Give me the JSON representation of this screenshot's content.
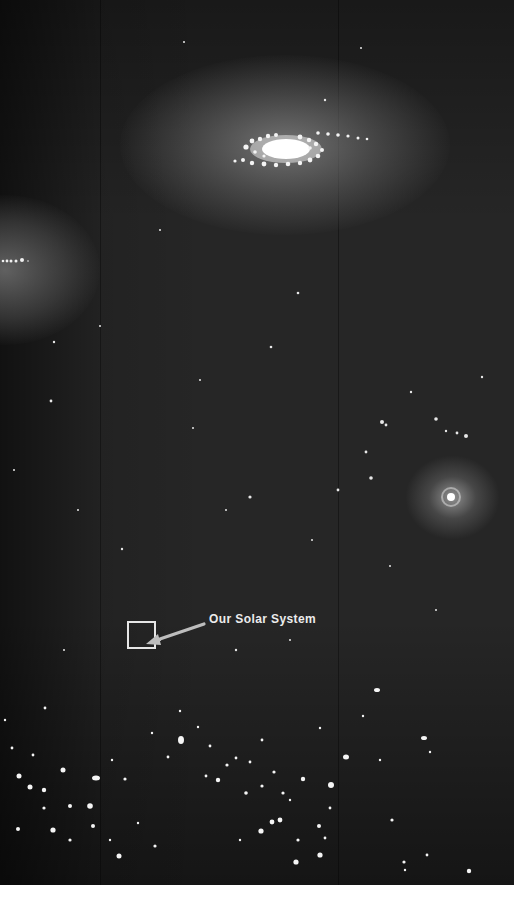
{
  "image": {
    "description": "Illustration of a spiral galaxy field with our Solar System's location marked",
    "background_color": "#262626",
    "margin_color": "#ffffff",
    "annotation": {
      "label": "Our Solar System",
      "label_color": "#ececec",
      "box_color": "#e6e6e6",
      "arrow_color": "#bdbdbd"
    },
    "features": [
      {
        "name": "spiral-galaxy",
        "position": "top-center"
      },
      {
        "name": "edge-on-galaxy-glow",
        "position": "left-middle"
      },
      {
        "name": "bright-star-halo",
        "position": "right-middle"
      },
      {
        "name": "dense-star-field",
        "position": "bottom"
      }
    ]
  }
}
